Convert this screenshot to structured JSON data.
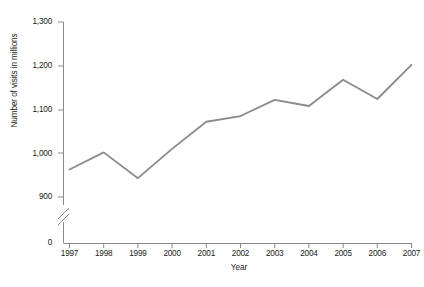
{
  "chart_data": {
    "type": "line",
    "title": "",
    "xlabel": "Year",
    "ylabel": "Number of visits in millions",
    "categories": [
      "1997",
      "1998",
      "1999",
      "2000",
      "2001",
      "2002",
      "2003",
      "2004",
      "2005",
      "2006",
      "2007"
    ],
    "values": [
      963,
      1002,
      943,
      1010,
      1072,
      1085,
      1122,
      1108,
      1168,
      1124,
      1202
    ],
    "series": [
      {
        "name": "Number of visits in millions",
        "values": [
          963,
          1002,
          943,
          1010,
          1072,
          1085,
          1122,
          1108,
          1168,
          1124,
          1202
        ]
      }
    ],
    "ylim": [
      900,
      1300
    ],
    "y_ticks": [
      "0",
      "900",
      "1,000",
      "1,100",
      "1,200",
      "1,300"
    ],
    "y_tick_values": [
      0,
      900,
      1000,
      1100,
      1200,
      1300
    ],
    "axis_break": true,
    "axis_break_note": "y-axis broken between 0 and 900",
    "grid": false,
    "legend": "none",
    "line_color": "#8a8a8a",
    "axis_color": "#8a8a8a",
    "text_color": "#1a1a1a",
    "background_color": "#ffffff"
  },
  "axes": {
    "y_title": "Number of visits in millions",
    "x_title": "Year",
    "y_tick_labels": [
      "1,300",
      "1,200",
      "1,100",
      "1,000",
      "900",
      "0"
    ],
    "x_tick_labels": [
      "1997",
      "1998",
      "1999",
      "2000",
      "2001",
      "2002",
      "2003",
      "2004",
      "2005",
      "2006",
      "2007"
    ]
  }
}
